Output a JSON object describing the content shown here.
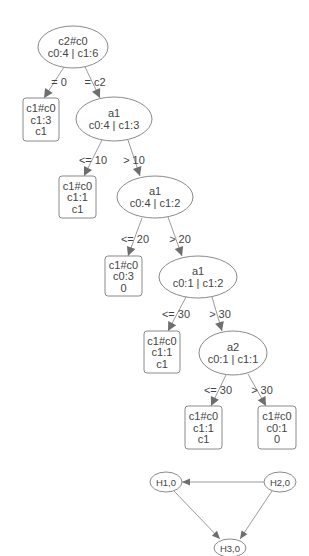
{
  "colors": {
    "background": "#ffffff",
    "node_stroke": "#8a8a8a",
    "edge": "#9a9a9a",
    "arrow": "#6e6e6e",
    "text": "#444444"
  },
  "decision_tree": {
    "nodes": [
      {
        "id": "n0",
        "shape": "ellipse",
        "cx": 73,
        "cy": 47,
        "rx": 35,
        "ry": 21,
        "lines": [
          "c2#c0",
          "c0:4 | c1:6"
        ]
      },
      {
        "id": "n1",
        "shape": "box",
        "x": 23,
        "y": 98,
        "w": 36,
        "h": 43,
        "lines": [
          "c1#c0",
          "c1:3",
          "c1"
        ]
      },
      {
        "id": "n2",
        "shape": "ellipse",
        "cx": 114,
        "cy": 119,
        "rx": 38,
        "ry": 22,
        "lines": [
          "a1",
          "c0:4 | c1:3"
        ]
      },
      {
        "id": "n3",
        "shape": "box",
        "x": 59,
        "y": 176,
        "w": 37,
        "h": 42,
        "lines": [
          "c1#c0",
          "c1:1",
          "c1"
        ]
      },
      {
        "id": "n4",
        "shape": "ellipse",
        "cx": 155,
        "cy": 197,
        "rx": 38,
        "ry": 21,
        "lines": [
          "a1",
          "c0:4 | c1:2"
        ]
      },
      {
        "id": "n5",
        "shape": "box",
        "x": 105,
        "y": 256,
        "w": 37,
        "h": 40,
        "lines": [
          "c1#c0",
          "c0:3",
          "0"
        ]
      },
      {
        "id": "n6",
        "shape": "ellipse",
        "cx": 198,
        "cy": 277,
        "rx": 39,
        "ry": 21,
        "lines": [
          "a1",
          "c0:1 | c1:2"
        ]
      },
      {
        "id": "n7",
        "shape": "box",
        "x": 144,
        "y": 331,
        "w": 36,
        "h": 42,
        "lines": [
          "c1#c0",
          "c1:1",
          "c1"
        ]
      },
      {
        "id": "n8",
        "shape": "ellipse",
        "cx": 233,
        "cy": 353,
        "rx": 34,
        "ry": 22,
        "lines": [
          "a2",
          "c0:1 | c1:1"
        ]
      },
      {
        "id": "n9",
        "shape": "box",
        "x": 185,
        "y": 406,
        "w": 37,
        "h": 43,
        "lines": [
          "c1#c0",
          "c1:1",
          "c1"
        ]
      },
      {
        "id": "n10",
        "shape": "box",
        "x": 258,
        "y": 406,
        "w": 38,
        "h": 43,
        "lines": [
          "c1#c0",
          "c0:1",
          "0"
        ]
      }
    ],
    "edges": [
      {
        "from": "n0",
        "to": "n1",
        "x1": 64,
        "y1": 67,
        "x2": 44,
        "y2": 98,
        "label": "= 0",
        "lx": 59,
        "ly": 86
      },
      {
        "from": "n0",
        "to": "n2",
        "x1": 85,
        "y1": 67,
        "x2": 100,
        "y2": 98,
        "label": "= c2",
        "lx": 95,
        "ly": 86
      },
      {
        "from": "n2",
        "to": "n3",
        "x1": 102,
        "y1": 140,
        "x2": 84,
        "y2": 176,
        "label": "<= 10",
        "lx": 93,
        "ly": 164
      },
      {
        "from": "n2",
        "to": "n4",
        "x1": 128,
        "y1": 140,
        "x2": 140,
        "y2": 176,
        "label": "> 10",
        "lx": 134,
        "ly": 164
      },
      {
        "from": "n4",
        "to": "n5",
        "x1": 142,
        "y1": 218,
        "x2": 128,
        "y2": 256,
        "label": "<= 20",
        "lx": 135,
        "ly": 243
      },
      {
        "from": "n4",
        "to": "n6",
        "x1": 168,
        "y1": 217,
        "x2": 182,
        "y2": 256,
        "label": "> 20",
        "lx": 180,
        "ly": 243
      },
      {
        "from": "n6",
        "to": "n7",
        "x1": 186,
        "y1": 297,
        "x2": 168,
        "y2": 331,
        "label": "<= 30",
        "lx": 176,
        "ly": 318
      },
      {
        "from": "n6",
        "to": "n8",
        "x1": 212,
        "y1": 297,
        "x2": 222,
        "y2": 331,
        "label": "> 30",
        "lx": 220,
        "ly": 318
      },
      {
        "from": "n8",
        "to": "n9",
        "x1": 226,
        "y1": 375,
        "x2": 211,
        "y2": 406,
        "label": "<= 30",
        "lx": 218,
        "ly": 394
      },
      {
        "from": "n8",
        "to": "n10",
        "x1": 248,
        "y1": 374,
        "x2": 266,
        "y2": 406,
        "label": "> 30",
        "lx": 262,
        "ly": 394
      }
    ]
  },
  "bayes_graph": {
    "nodes": [
      {
        "id": "h1",
        "label": "H1,0",
        "cx": 166,
        "cy": 482,
        "rx": 16,
        "ry": 10
      },
      {
        "id": "h2",
        "label": "H2,0",
        "cx": 280,
        "cy": 482,
        "rx": 16,
        "ry": 10
      },
      {
        "id": "h3",
        "label": "H3,0",
        "cx": 230,
        "cy": 548,
        "rx": 16,
        "ry": 9
      }
    ],
    "edges": [
      {
        "from": "h2",
        "to": "h1",
        "x1": 264,
        "y1": 482,
        "x2": 182,
        "y2": 482
      },
      {
        "from": "h1",
        "to": "h3",
        "x1": 174,
        "y1": 491,
        "x2": 220,
        "y2": 539
      },
      {
        "from": "h2",
        "to": "h3",
        "x1": 272,
        "y1": 491,
        "x2": 240,
        "y2": 539
      }
    ]
  }
}
